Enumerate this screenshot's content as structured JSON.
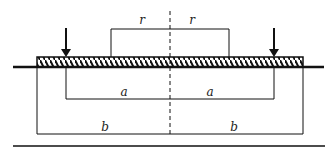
{
  "diagram": {
    "labels": {
      "r_left": "r",
      "r_right": "r",
      "a_left": "a",
      "a_right": "a",
      "b_left": "b",
      "b_right": "b"
    },
    "elements": [
      "centerline (dashed)",
      "hatched plate",
      "ground line",
      "two downward load arrows",
      "r dimension box",
      "a dimension bracket",
      "b dimension bracket",
      "bottom rule"
    ],
    "colors": {
      "stroke": "#111111",
      "background": "#ffffff"
    }
  }
}
